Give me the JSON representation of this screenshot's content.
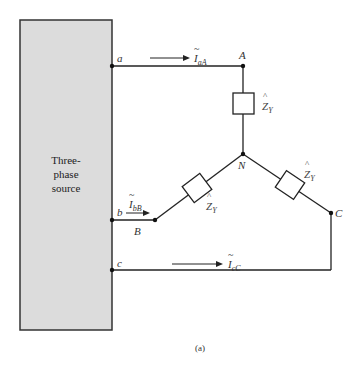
{
  "source": {
    "label_lines": [
      "Three-",
      "phase",
      "source"
    ],
    "fill": "#dcdcdc"
  },
  "terminals": {
    "a": "a",
    "b": "b",
    "c": "c"
  },
  "nodes": {
    "A": "A",
    "B": "B",
    "C": "C",
    "N": "N"
  },
  "currents": {
    "aA": {
      "symbol": "I",
      "sub": "aA"
    },
    "bB": {
      "symbol": "I",
      "sub": "bB"
    },
    "cC": {
      "symbol": "I",
      "sub": "cC"
    }
  },
  "impedances": [
    {
      "symbol": "Z",
      "sub": "Y",
      "branch": "A-N"
    },
    {
      "symbol": "Z",
      "sub": "Y",
      "branch": "B-N"
    },
    {
      "symbol": "Z",
      "sub": "Y",
      "branch": "C-N"
    }
  ],
  "caption": "(a)"
}
